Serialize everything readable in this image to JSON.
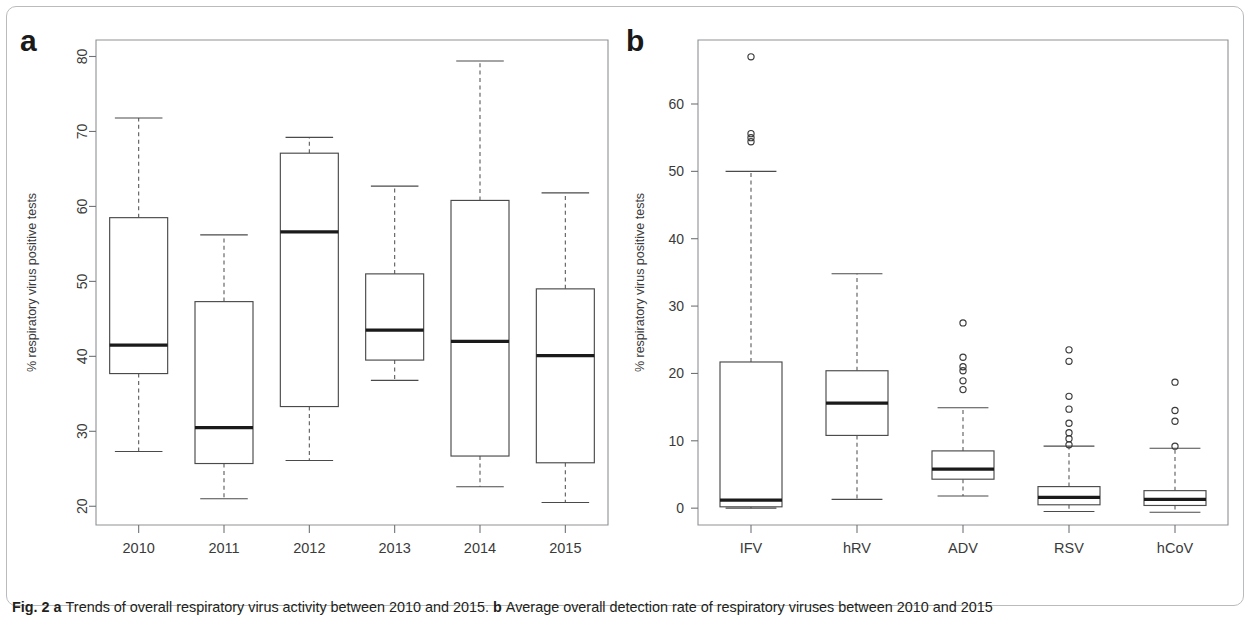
{
  "figure": {
    "caption_prefix": "Fig. 2",
    "caption_a_marker": "a",
    "caption_a_text": "Trends of overall respiratory virus activity between 2010 and 2015.",
    "caption_b_marker": "b",
    "caption_b_text": "Average overall detection rate of respiratory viruses between 2010 and 2015",
    "panel_a_letter": "a",
    "panel_b_letter": "b"
  },
  "chart_data": [
    {
      "type": "box",
      "panel": "a",
      "title": "Trends of overall respiratory virus activity between 2010 and 2015",
      "xlabel": "",
      "ylabel": "% respiratory virus positive tests",
      "ylim": [
        17.5,
        82.2
      ],
      "yticks": [
        20,
        30,
        40,
        50,
        60,
        70,
        80
      ],
      "ytick_labels": [
        "20",
        "30",
        "40",
        "50",
        "60",
        "70",
        "80"
      ],
      "categories": [
        "2010",
        "2011",
        "2012",
        "2013",
        "2014",
        "2015"
      ],
      "grid": false,
      "legend": "none",
      "boxes": [
        {
          "category": "2010",
          "whisker_low": 27.3,
          "q1": 37.7,
          "median": 41.5,
          "q3": 58.5,
          "whisker_high": 71.8,
          "outliers": []
        },
        {
          "category": "2011",
          "whisker_low": 21.0,
          "q1": 25.7,
          "median": 30.5,
          "q3": 47.3,
          "whisker_high": 56.2,
          "outliers": []
        },
        {
          "category": "2012",
          "whisker_low": 26.1,
          "q1": 33.3,
          "median": 56.6,
          "q3": 67.1,
          "whisker_high": 69.2,
          "outliers": []
        },
        {
          "category": "2013",
          "whisker_low": 36.8,
          "q1": 39.5,
          "median": 43.5,
          "q3": 51.0,
          "whisker_high": 62.7,
          "outliers": []
        },
        {
          "category": "2014",
          "whisker_low": 22.6,
          "q1": 26.7,
          "median": 42.0,
          "q3": 60.8,
          "whisker_high": 79.4,
          "outliers": []
        },
        {
          "category": "2015",
          "whisker_low": 20.5,
          "q1": 25.8,
          "median": 40.1,
          "q3": 49.0,
          "whisker_high": 61.8,
          "outliers": []
        }
      ]
    },
    {
      "type": "box",
      "panel": "b",
      "title": "Average overall detection rate of respiratory viruses between 2010 and 2015",
      "xlabel": "",
      "ylabel": "% respiratory virus positive tests",
      "ylim": [
        -2.5,
        69.5
      ],
      "yticks": [
        0,
        10,
        20,
        30,
        40,
        50,
        60
      ],
      "ytick_labels": [
        "0",
        "10",
        "20",
        "30",
        "40",
        "50",
        "60"
      ],
      "categories": [
        "IFV",
        "hRV",
        "ADV",
        "RSV",
        "hCoV"
      ],
      "grid": false,
      "legend": "none",
      "boxes": [
        {
          "category": "IFV",
          "whisker_low": 0.0,
          "q1": 0.2,
          "median": 1.2,
          "q3": 21.7,
          "whisker_high": 50.0,
          "outliers": [
            67.0,
            55.6,
            55.0,
            54.4
          ]
        },
        {
          "category": "hRV",
          "whisker_low": 1.3,
          "q1": 10.8,
          "median": 15.6,
          "q3": 20.4,
          "whisker_high": 34.8,
          "outliers": []
        },
        {
          "category": "ADV",
          "whisker_low": 1.8,
          "q1": 4.3,
          "median": 5.8,
          "q3": 8.5,
          "whisker_high": 14.9,
          "outliers": [
            27.5,
            22.4,
            21.0,
            20.4,
            18.9,
            17.6
          ]
        },
        {
          "category": "RSV",
          "whisker_low": -0.5,
          "q1": 0.5,
          "median": 1.6,
          "q3": 3.2,
          "whisker_high": 9.2,
          "outliers": [
            23.5,
            21.8,
            16.6,
            14.7,
            12.6,
            11.2,
            10.3,
            9.4
          ]
        },
        {
          "category": "hCoV",
          "whisker_low": -0.6,
          "q1": 0.4,
          "median": 1.3,
          "q3": 2.6,
          "whisker_high": 8.9,
          "outliers": [
            18.7,
            14.5,
            12.9,
            9.2
          ]
        }
      ]
    }
  ],
  "colors": {
    "frame": "#8d9194",
    "box_stroke": "#4a4a4a",
    "median": "#1a1a1a",
    "text": "#3a3a3a",
    "background": "#ffffff"
  }
}
